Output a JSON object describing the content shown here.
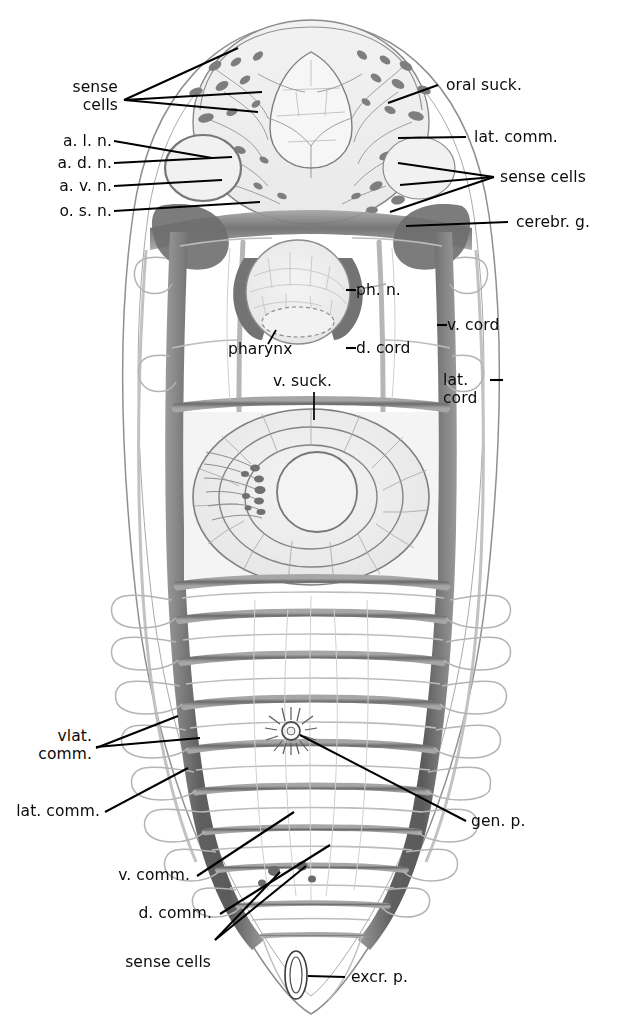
{
  "figure": {
    "kind": "anatomical-illustration",
    "background_color": "#ffffff",
    "ink_color": "#0b0b0b",
    "tissue_color": "#8d8d8d"
  },
  "labels": {
    "sense_cells_top": "sense\ncells",
    "a_l_n": "a. l. n.",
    "a_d_n": "a. d. n.",
    "a_v_n": "a. v. n.",
    "o_s_n": "o. s. n.",
    "oral_suck": "oral suck.",
    "lat_comm_top": "lat. comm.",
    "sense_cells_right": "sense cells",
    "cerebr_g": "cerebr. g.",
    "ph_n": "ph. n.",
    "pharynx": "pharynx",
    "d_cord": "d. cord",
    "v_cord": "v. cord",
    "lat_cord": "lat.\ncord",
    "v_suck": "v. suck.",
    "vlat_comm": "vlat.\ncomm.",
    "lat_comm_bottom": "lat. comm.",
    "v_comm": "v. comm.",
    "d_comm": "d. comm.",
    "sense_cells_bottom": "sense cells",
    "gen_p": "gen. p.",
    "excr_p": "excr. p."
  },
  "structures": {
    "body_outline": "elongate oval body, widest at mid, tapering to pointed posterior",
    "oral_sucker": "large rounded anterior sucker with radial nerve plexus",
    "pharynx": "spherical muscular pharynx below oral sucker",
    "ventral_sucker": "large concentric-ringed acetabulum at mid body",
    "nerve_cords": "paired ventral, dorsal and lateral longitudinal cords joined by transverse commissures forming a ladder",
    "genital_pore": "small radiate starburst pore on midline",
    "excretory_pore": "small vertical ellipse at posterior tip"
  }
}
